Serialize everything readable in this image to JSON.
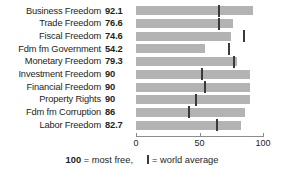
{
  "chart_data": {
    "type": "bar",
    "orientation": "horizontal",
    "title": "",
    "xlabel": "",
    "ylabel": "",
    "xlim": [
      0,
      100
    ],
    "xticks": [
      0,
      50,
      100
    ],
    "xticklabels": [
      "0",
      "50",
      "100"
    ],
    "grid": false,
    "categories": [
      "Business Freedom",
      "Trade Freedom",
      "Fiscal Freedom",
      "Fdm fm Government",
      "Monetary Freedom",
      "Investment Freedom",
      "Financial Freedom",
      "Property Rights",
      "Fdm fm Corruption",
      "Labor Freedom"
    ],
    "values": [
      92.1,
      76.6,
      74.6,
      54.2,
      79.3,
      90,
      90,
      90,
      86,
      82.7
    ],
    "value_labels": [
      "92.1",
      "76.6",
      "74.6",
      "54.2",
      "79.3",
      "90",
      "90",
      "90",
      "86",
      "82.7"
    ],
    "series": [
      {
        "name": "Score",
        "values": [
          92.1,
          76.6,
          74.6,
          54.2,
          79.3,
          90,
          90,
          90,
          86,
          82.7
        ]
      },
      {
        "name": "world average",
        "marker": "tick",
        "values": [
          65,
          65,
          85,
          73,
          77,
          52,
          54,
          47,
          42,
          64
        ]
      }
    ],
    "colors": {
      "bar": "#b3b3b3",
      "marker": "#3a3a3a",
      "axis": "#8c8c8c",
      "text": "#231f20",
      "background": "#ffffff"
    }
  },
  "legend": {
    "most_free_number": "100",
    "most_free_text": "= most free,",
    "world_average_text": "= world average",
    "marker_icon": "world-average-tick-icon"
  }
}
